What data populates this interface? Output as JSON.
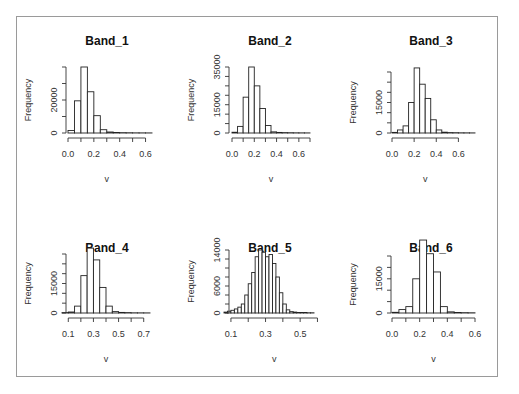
{
  "chart_data": [
    {
      "type": "bar",
      "title": "Band_1",
      "xlabel": "v",
      "ylabel": "Frequency",
      "bin_width": 0.05,
      "bin_start": 0.0,
      "values": [
        1500,
        19500,
        40000,
        25000,
        10500,
        2000,
        600,
        300,
        200,
        150,
        100,
        80,
        60
      ],
      "xlim": [
        0.0,
        0.65
      ],
      "ylim": [
        0,
        40000
      ],
      "xticks": [
        0.0,
        0.1,
        0.2,
        0.3,
        0.4,
        0.5,
        0.6
      ],
      "xtick_labels": [
        "0.0",
        "",
        "0.2",
        "",
        "0.4",
        "",
        "0.6"
      ],
      "yticks": [
        0,
        10000,
        20000,
        30000,
        40000
      ],
      "ytick_labels": [
        "0",
        "",
        "20000",
        "",
        ""
      ]
    },
    {
      "type": "bar",
      "title": "Band_2",
      "xlabel": "v",
      "ylabel": "Frequency",
      "bin_width": 0.05,
      "bin_start": 0.0,
      "values": [
        400,
        3500,
        19000,
        35000,
        25000,
        13000,
        4000,
        600,
        300,
        200,
        150,
        100,
        80,
        60
      ],
      "xlim": [
        0.0,
        0.7
      ],
      "ylim": [
        0,
        35000
      ],
      "xticks": [
        0.0,
        0.1,
        0.2,
        0.3,
        0.4,
        0.5,
        0.6,
        0.7
      ],
      "xtick_labels": [
        "0.0",
        "",
        "0.2",
        "",
        "0.4",
        "",
        "0.6",
        ""
      ],
      "yticks": [
        0,
        5000,
        10000,
        15000,
        20000,
        25000,
        30000,
        35000
      ],
      "ytick_labels": [
        "0",
        "",
        "",
        "15000",
        "",
        "",
        "",
        "35000"
      ]
    },
    {
      "type": "bar",
      "title": "Band_3",
      "xlabel": "v",
      "ylabel": "Frequency",
      "bin_width": 0.05,
      "bin_start": 0.0,
      "values": [
        300,
        1500,
        3500,
        15000,
        32000,
        24000,
        17000,
        6500,
        1500,
        400,
        200,
        150,
        100,
        80,
        60
      ],
      "xlim": [
        0.0,
        0.75
      ],
      "ylim": [
        0,
        30000
      ],
      "xticks": [
        0.0,
        0.2,
        0.4,
        0.6
      ],
      "xtick_labels": [
        "0.0",
        "0.2",
        "0.4",
        "0.6"
      ],
      "yticks": [
        0,
        5000,
        10000,
        15000,
        20000,
        25000,
        30000
      ],
      "ytick_labels": [
        "0",
        "",
        "",
        "15000",
        "",
        "",
        ""
      ]
    },
    {
      "type": "bar",
      "title": "Band_4",
      "xlabel": "v",
      "ylabel": "Frequency",
      "bin_width": 0.05,
      "bin_start": 0.05,
      "values": [
        200,
        500,
        3500,
        19000,
        33000,
        27000,
        13000,
        3500,
        700,
        300,
        200,
        100,
        80,
        60
      ],
      "xlim": [
        0.05,
        0.75
      ],
      "ylim": [
        0,
        30000
      ],
      "xticks": [
        0.1,
        0.2,
        0.3,
        0.4,
        0.5,
        0.6,
        0.7
      ],
      "xtick_labels": [
        "0.1",
        "",
        "0.3",
        "",
        "0.5",
        "",
        "0.7"
      ],
      "yticks": [
        0,
        5000,
        10000,
        15000,
        20000,
        25000,
        30000
      ],
      "ytick_labels": [
        "0",
        "",
        "",
        "15000",
        "",
        "",
        ""
      ]
    },
    {
      "type": "bar",
      "title": "Band_5",
      "xlabel": "v",
      "ylabel": "Frequency",
      "bin_width": 0.02,
      "bin_start": 0.06,
      "values": [
        200,
        400,
        600,
        900,
        1300,
        2000,
        4000,
        6500,
        9000,
        12500,
        14000,
        13500,
        12500,
        13000,
        11000,
        8000,
        4500,
        2000,
        700,
        300,
        200,
        100,
        100,
        100,
        50,
        50
      ],
      "xlim": [
        0.06,
        0.58
      ],
      "ylim": [
        0,
        14000
      ],
      "xticks": [
        0.1,
        0.2,
        0.3,
        0.4,
        0.5,
        0.6
      ],
      "xtick_labels": [
        "0.1",
        "",
        "0.3",
        "",
        "0.5",
        ""
      ],
      "yticks": [
        0,
        2000,
        4000,
        6000,
        8000,
        10000,
        12000,
        14000
      ],
      "ytick_labels": [
        "0",
        "",
        "",
        "6000",
        "",
        "",
        "",
        "14000"
      ]
    },
    {
      "type": "bar",
      "title": "Band_6",
      "xlabel": "v",
      "ylabel": "Frequency",
      "bin_width": 0.05,
      "bin_start": 0.0,
      "values": [
        300,
        1500,
        2800,
        15000,
        32000,
        26000,
        18000,
        2800,
        500,
        200,
        150,
        100
      ],
      "xlim": [
        0.0,
        0.6
      ],
      "ylim": [
        0,
        25000
      ],
      "xticks": [
        0.0,
        0.1,
        0.2,
        0.3,
        0.4,
        0.5,
        0.6
      ],
      "xtick_labels": [
        "0.0",
        "",
        "0.2",
        "",
        "0.4",
        "",
        "0.6"
      ],
      "yticks": [
        0,
        5000,
        10000,
        15000,
        20000,
        25000
      ],
      "ytick_labels": [
        "0",
        "",
        "",
        "15000",
        "",
        ""
      ]
    }
  ]
}
